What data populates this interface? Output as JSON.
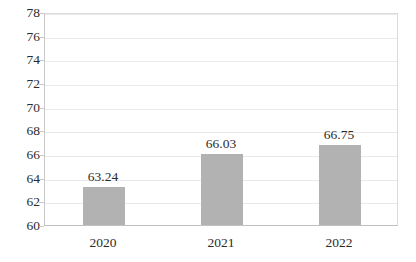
{
  "chart_data": {
    "type": "bar",
    "title": "",
    "subtitle": "",
    "xlabel": "",
    "ylabel": "",
    "categories": [
      "2020",
      "2021",
      "2022"
    ],
    "values": [
      63.24,
      66.03,
      66.75
    ],
    "value_labels": [
      "63.24",
      "66.03",
      "66.75"
    ],
    "series": [
      {
        "name": "",
        "values": [
          63.24,
          66.03,
          66.75
        ]
      }
    ],
    "ylim": [
      60,
      78
    ],
    "y_ticks": [
      60,
      62,
      64,
      66,
      68,
      70,
      72,
      74,
      76,
      78
    ],
    "y_tick_labels": [
      "60",
      "62",
      "64",
      "66",
      "68",
      "70",
      "72",
      "74",
      "76",
      "78"
    ],
    "grid": true,
    "grid_axis": "y",
    "legend": false,
    "legend_position": "none",
    "bar_color": "#b2b2b2",
    "gridline_color": "#e9e9e9",
    "axis_color": "#c8c8c8",
    "text_color": "#2b2b2b",
    "background_color": "#ffffff"
  }
}
